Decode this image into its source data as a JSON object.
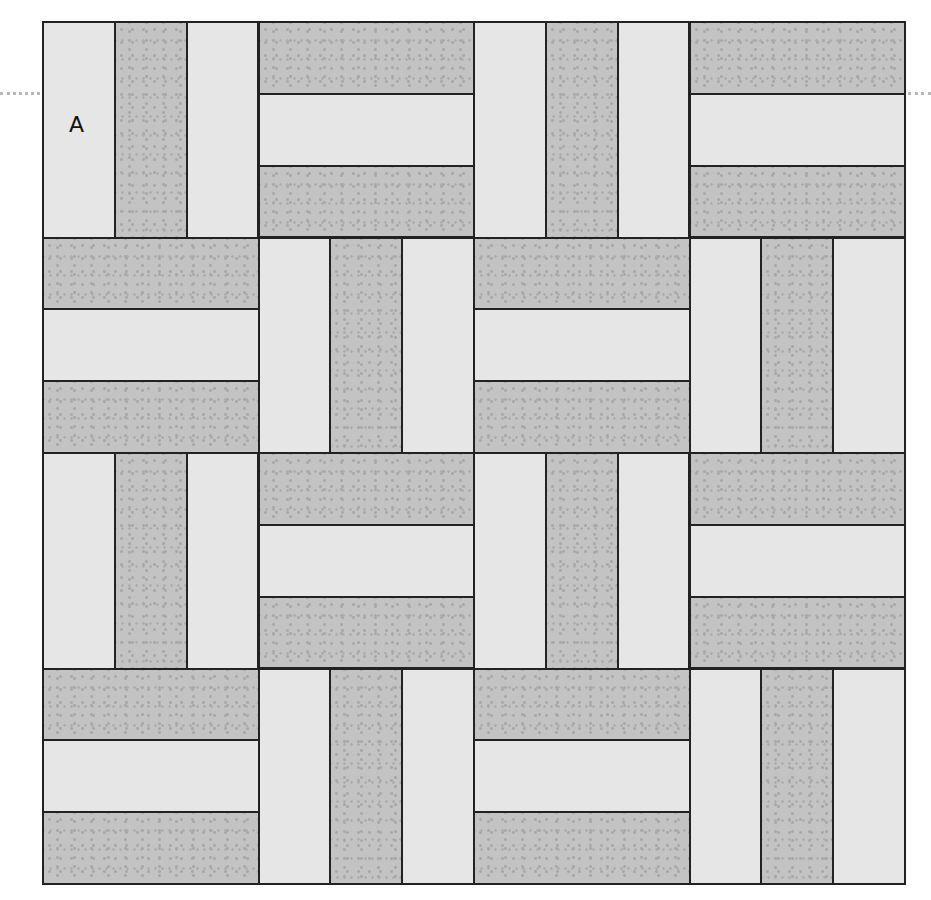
{
  "diagram": {
    "grid": {
      "rows": 4,
      "columns": 4,
      "strips_per_block": 3
    },
    "label": "A",
    "colors": {
      "light_fabric": "#e6e6e6",
      "dark_fabric": "#c3c3c3",
      "dot": "#a9a9a9",
      "seam": "#222222"
    },
    "blocks": [
      [
        "vertical",
        "horizontal",
        "vertical",
        "horizontal"
      ],
      [
        "horizontal",
        "vertical",
        "horizontal",
        "vertical"
      ],
      [
        "vertical",
        "horizontal",
        "vertical",
        "horizontal"
      ],
      [
        "horizontal",
        "vertical",
        "horizontal",
        "vertical"
      ]
    ],
    "strip_pattern": {
      "vertical": [
        "light",
        "dark",
        "light"
      ],
      "horizontal": [
        "dark",
        "light",
        "dark"
      ]
    }
  }
}
